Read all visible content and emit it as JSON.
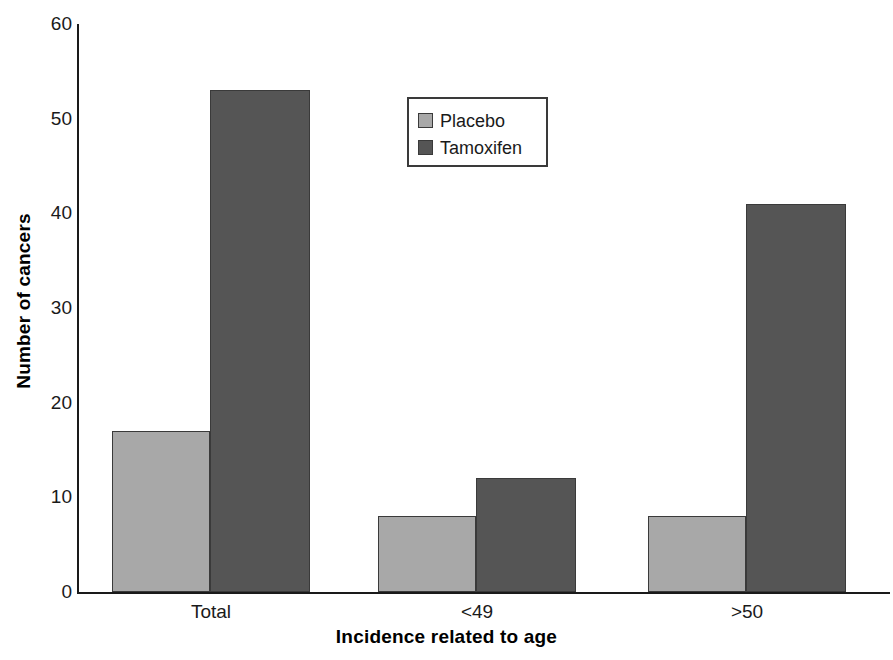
{
  "chart_data": {
    "type": "bar",
    "title": "",
    "subtitle": "",
    "xlabel": "Incidence related to age",
    "ylabel": "Number of cancers",
    "categories": [
      "Total",
      "<49",
      ">50"
    ],
    "series": [
      {
        "name": "Placebo",
        "color": "#a8a8a8",
        "values": [
          17,
          8,
          8
        ]
      },
      {
        "name": "Tamoxifen",
        "color": "#555555",
        "values": [
          53,
          12,
          41
        ]
      }
    ],
    "ylim": [
      0,
      60
    ],
    "yticks": [
      0,
      10,
      20,
      30,
      40,
      50,
      60
    ],
    "ytick_labels": [
      "0",
      "10",
      "20",
      "30",
      "40",
      "50",
      "60"
    ],
    "grid": false,
    "legend_position": "upper-center",
    "bar_group_mode": "grouped-adjacent"
  },
  "legend": {
    "entries": [
      {
        "label": "Placebo",
        "swatch": "legend-swatch-placebo"
      },
      {
        "label": "Tamoxifen",
        "swatch": "legend-swatch-tamoxifen"
      }
    ]
  },
  "axes": {
    "y_title": "Number of cancers",
    "x_title": "Incidence related to age"
  },
  "colors": {
    "placebo": "#a8a8a8",
    "tamoxifen": "#555555",
    "axis": "#1a1a1a",
    "background": "#ffffff"
  }
}
